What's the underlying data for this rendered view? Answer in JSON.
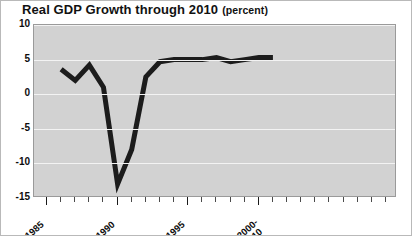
{
  "chart_data": {
    "type": "line",
    "title": "Real GDP Growth through 2010",
    "subtitle": "(percent)",
    "xlabel": "",
    "ylabel": "",
    "ylim": [
      -15,
      10
    ],
    "xlim": [
      1985,
      2010
    ],
    "grid": true,
    "legend": null,
    "yticks": [
      10,
      5,
      0,
      -5,
      -10,
      -15
    ],
    "ytick_labels": [
      "10",
      "5",
      "0",
      "-5",
      "-10",
      "-15"
    ],
    "xticks": [
      1985,
      1990,
      1995,
      2000
    ],
    "xtick_labels": [
      "1985",
      "1990",
      "1995",
      "2000-\n2010"
    ],
    "xtick_labels_display": [
      {
        "line1": "1985",
        "line2": ""
      },
      {
        "line1": "1990",
        "line2": ""
      },
      {
        "line1": "1995",
        "line2": ""
      },
      {
        "line1": "2000-",
        "line2": "2010"
      }
    ],
    "minor_xticks": [
      1986,
      1987,
      1988,
      1989,
      1991,
      1992,
      1993,
      1994,
      1996,
      1997,
      1998,
      1999,
      2001,
      2002,
      2003,
      2004,
      2005,
      2006,
      2007,
      2008,
      2009
    ],
    "series": [
      {
        "name": "Real GDP Growth",
        "color": "#1c1c1c",
        "x": [
          1986,
          1987,
          1988,
          1989,
          1990,
          1991,
          1992,
          1993,
          1994,
          1995,
          1996,
          1997,
          1998,
          1999,
          2000,
          2001
        ],
        "values": [
          3.6,
          2.0,
          4.2,
          1.0,
          -13.0,
          -8.0,
          2.5,
          4.7,
          5.0,
          5.0,
          5.0,
          5.3,
          4.7,
          5.0,
          5.3,
          5.3
        ]
      }
    ],
    "plot_background": "#d2d2d2",
    "gridline_color": "#f3f3f3",
    "axis_color": "#9a9a9a",
    "text_color": "#0d0d0d"
  }
}
